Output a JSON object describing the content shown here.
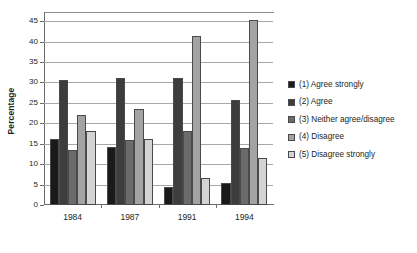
{
  "chart_data": {
    "type": "bar",
    "title": "",
    "xlabel": "",
    "ylabel": "Percentage",
    "ylim": [
      0,
      47
    ],
    "yticks": [
      0,
      5,
      10,
      15,
      20,
      25,
      30,
      35,
      40,
      45
    ],
    "grid": true,
    "legend_position": "right",
    "categories": [
      "1984",
      "1987",
      "1991",
      "1994"
    ],
    "series": [
      {
        "name": "(1) Agree strongly",
        "color": "#1a1a1a",
        "values": [
          16.2,
          14.2,
          4.4,
          5.3
        ]
      },
      {
        "name": "(2) Agree",
        "color": "#3d3d3d",
        "values": [
          30.5,
          31.1,
          31.0,
          25.6
        ]
      },
      {
        "name": "(3) Neither agree/disagree",
        "color": "#6b6b6b",
        "values": [
          13.5,
          16.0,
          18.0,
          14.0
        ]
      },
      {
        "name": "(4) Disagree",
        "color": "#a3a3a3",
        "values": [
          22.1,
          23.4,
          41.4,
          45.3
        ]
      },
      {
        "name": "(5) Disagree strongly",
        "color": "#d4d4d4",
        "values": [
          18.0,
          16.1,
          6.5,
          11.5
        ]
      }
    ]
  },
  "axis": {
    "y_title": "Percentage"
  },
  "legend": {
    "items": [
      {
        "label": "(1) Agree strongly",
        "color": "#1a1a1a"
      },
      {
        "label": "(2) Agree",
        "color": "#3d3d3d"
      },
      {
        "label": "(3) Neither agree/disagree",
        "color": "#6b6b6b"
      },
      {
        "label": "(4) Disagree",
        "color": "#a3a3a3"
      },
      {
        "label": "(5) Disagree strongly",
        "color": "#d4d4d4"
      }
    ]
  }
}
